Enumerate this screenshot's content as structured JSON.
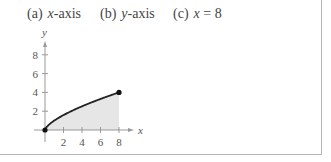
{
  "parts": [
    {
      "label": "(a)",
      "var": "x",
      "text": "-axis"
    },
    {
      "label": "(b)",
      "var": "y",
      "text": "-axis"
    },
    {
      "label": "(c)",
      "var": "x",
      "text": " = 8"
    }
  ],
  "chart_data": {
    "type": "area",
    "title": "",
    "function": "y = x^(2/3)",
    "xlabel": "x",
    "ylabel": "y",
    "x_ticks": [
      "2",
      "4",
      "6",
      "8"
    ],
    "y_ticks": [
      "2",
      "4",
      "6",
      "8"
    ],
    "xlim": [
      0,
      8
    ],
    "ylim": [
      0,
      8
    ],
    "x": [
      0,
      1,
      2,
      3,
      4,
      5,
      6,
      7,
      8
    ],
    "values": [
      0,
      1,
      1.59,
      2.08,
      2.52,
      2.92,
      3.3,
      3.66,
      4
    ],
    "endpoints": [
      [
        0,
        0
      ],
      [
        8,
        4
      ]
    ],
    "shaded_region": "under curve from x=0 to x=8",
    "grid": false,
    "colors": {
      "curve": "#222222",
      "fill": "#e6e6e6",
      "axis": "#888888"
    }
  }
}
